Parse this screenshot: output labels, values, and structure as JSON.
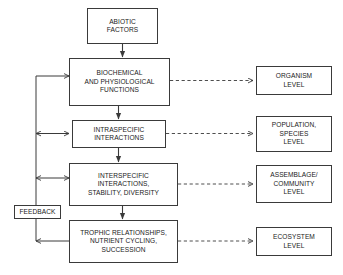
{
  "diagram": {
    "background_color": "#ffffff",
    "line_color": "#3a3a3a",
    "text_color": "#1a1a1a",
    "nodes": {
      "abiotic": {
        "lines": [
          "ABIOTIC",
          "FACTORS"
        ]
      },
      "biochemical": {
        "lines": [
          "BIOCHEMICAL",
          "AND PHYSIOLOGICAL",
          "FUNCTIONS"
        ]
      },
      "intraspecific": {
        "lines": [
          "INTRASPECIFIC",
          "INTERACTIONS"
        ]
      },
      "interspecific": {
        "lines": [
          "INTERSPECIFIC",
          "INTERACTIONS,",
          "STABILITY, DIVERSITY"
        ]
      },
      "trophic": {
        "lines": [
          "TROPHIC RELATIONSHIPS,",
          "NUTRIENT CYCLING,",
          "SUCCESSION"
        ]
      },
      "organism_level": {
        "lines": [
          "ORGANISM",
          "LEVEL"
        ]
      },
      "population_level": {
        "lines": [
          "POPULATION,",
          "SPECIES",
          "LEVEL"
        ]
      },
      "community_level": {
        "lines": [
          "ASSEMBLAGE/",
          "COMMUNITY",
          "LEVEL"
        ]
      },
      "ecosystem_level": {
        "lines": [
          "ECOSYSTEM",
          "LEVEL"
        ]
      },
      "feedback": {
        "lines": [
          "FEEDBACK"
        ]
      }
    }
  }
}
